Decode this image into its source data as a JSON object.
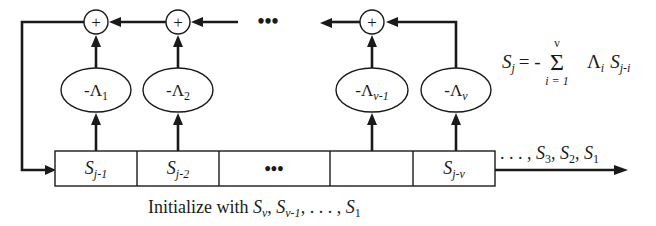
{
  "diagram": {
    "type": "linear-feedback-shift-register",
    "formula": {
      "lhs": "S",
      "lhs_sub": "j",
      "equals": "= -",
      "sum_symbol": "Σ",
      "sum_upper": "ν",
      "sum_lower": "i = 1",
      "term_lambda": "Λ",
      "term_lambda_sub": "i",
      "term_s": "S",
      "term_s_sub": "j-i"
    },
    "adders": [
      {
        "symbol": "+"
      },
      {
        "symbol": "+"
      },
      {
        "symbol": "+"
      }
    ],
    "adder_chain_ellipsis": "•••",
    "multipliers": [
      {
        "prefix": "-Λ",
        "sub": "1"
      },
      {
        "prefix": "-Λ",
        "sub": "2"
      },
      {
        "prefix": "-Λ",
        "sub": "ν-1"
      },
      {
        "prefix": "-Λ",
        "sub": "ν"
      }
    ],
    "register_cells": [
      {
        "main": "S",
        "sub": "j-1"
      },
      {
        "main": "S",
        "sub": "j-2"
      },
      {
        "main": "•••",
        "sub": ""
      },
      {
        "main": "",
        "sub": ""
      },
      {
        "main": "S",
        "sub": "j-ν"
      }
    ],
    "output_label": {
      "prefix": ". . . , ",
      "items": [
        {
          "main": "S",
          "sub": "3"
        },
        {
          "main": "S",
          "sub": "2"
        },
        {
          "main": "S",
          "sub": "1"
        }
      ]
    },
    "caption": {
      "text": "Initialize with ",
      "items": [
        {
          "main": "S",
          "sub": "ν"
        },
        {
          "main": "S",
          "sub": "ν-1"
        }
      ],
      "ellipsis": ", . . . , ",
      "last": {
        "main": "S",
        "sub": "1"
      }
    }
  }
}
